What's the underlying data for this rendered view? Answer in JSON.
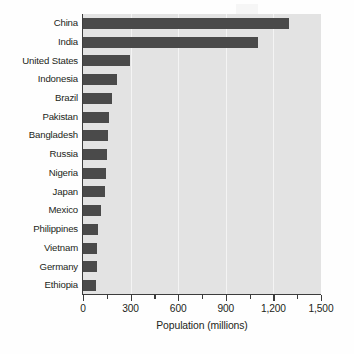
{
  "chart_data": {
    "type": "bar",
    "orientation": "horizontal",
    "title": "",
    "xlabel": "Population (millions)",
    "ylabel": "",
    "xlim": [
      0,
      1500
    ],
    "xticks": [
      0,
      300,
      600,
      900,
      1200,
      1500
    ],
    "xtick_labels": [
      "0",
      "300",
      "600",
      "900",
      "1,200",
      "1,500"
    ],
    "minor_xticks": [
      150,
      450,
      750,
      1050,
      1350
    ],
    "grid": "vertical",
    "legend": "none",
    "categories": [
      "China",
      "India",
      "United States",
      "Indonesia",
      "Brazil",
      "Pakistan",
      "Bangladesh",
      "Russia",
      "Nigeria",
      "Japan",
      "Mexico",
      "Philippines",
      "Vietnam",
      "Germany",
      "Ethiopia"
    ],
    "values": [
      1300,
      1100,
      295,
      215,
      185,
      165,
      155,
      150,
      145,
      140,
      115,
      95,
      90,
      90,
      85
    ],
    "bar_color": "#4a4a4a",
    "plot_background": "#e3e3e3",
    "gridline_color": "#f4f4f4",
    "axis_color": "#3c3c3c"
  },
  "axis": {
    "x_title": "Population (millions)"
  }
}
